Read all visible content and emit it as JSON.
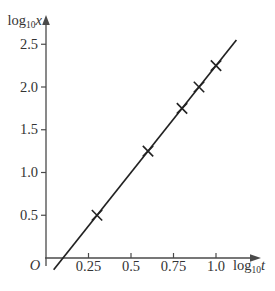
{
  "chart_data": {
    "type": "scatter",
    "title": "",
    "xlabel": "log10 t",
    "ylabel": "log10 x",
    "xlabel_parts": {
      "func": "log",
      "sub": "10",
      "var": "t"
    },
    "ylabel_parts": {
      "func": "log",
      "sub": "10",
      "var": "x"
    },
    "origin_label": "O",
    "x_ticks": {
      "values": [
        0.25,
        0.5,
        0.75,
        1.0
      ],
      "labels": [
        "0.25",
        "0.5",
        "0.75",
        "1.0"
      ]
    },
    "y_ticks": {
      "values": [
        0.5,
        1.0,
        1.5,
        2.0,
        2.5
      ],
      "labels": [
        "0.5",
        "1.0",
        "1.5",
        "2.0",
        "2.5"
      ]
    },
    "xlim": [
      0,
      1.27
    ],
    "ylim": [
      0,
      2.85
    ],
    "grid": false,
    "legend": false,
    "marker_style": "x",
    "points": [
      {
        "log10_t": 0.3,
        "log10_x": 0.5
      },
      {
        "log10_t": 0.6,
        "log10_x": 1.25
      },
      {
        "log10_t": 0.8,
        "log10_x": 1.75
      },
      {
        "log10_t": 0.9,
        "log10_x": 2.0
      },
      {
        "log10_t": 1.0,
        "log10_x": 2.25
      }
    ],
    "line": {
      "t_start": 0.045,
      "t_end": 1.12,
      "slope": 2.5,
      "intercept": -0.25
    },
    "colors": {
      "background": "#ffffff",
      "axis": "#4a4a4a",
      "text": "#333333",
      "data_line": "#222222",
      "marker": "#222222"
    }
  }
}
